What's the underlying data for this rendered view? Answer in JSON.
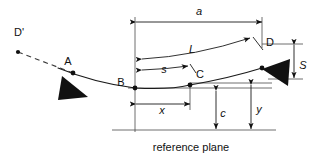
{
  "figure": {
    "type": "engineering-diagram",
    "background_color": "#ffffff",
    "line_color": "#1a1a1a",
    "thin_line_color": "#4a4a4a"
  },
  "points": {
    "d_prime": {
      "label": "D'",
      "x": 18,
      "y": 52,
      "label_x": 14,
      "label_y": 36
    },
    "a": {
      "label": "A",
      "x": 73,
      "y": 73,
      "label_x": 68,
      "label_y": 64
    },
    "b": {
      "label": "B",
      "x": 135,
      "y": 88,
      "label_x": 122,
      "label_y": 84
    },
    "c": {
      "label": "C",
      "x": 190,
      "y": 85,
      "label_x": 196,
      "label_y": 78
    },
    "d": {
      "label": "D",
      "x": 262,
      "y": 68,
      "label_x": 267,
      "label_y": 40
    }
  },
  "dimensions": {
    "a": {
      "label": "a",
      "label_x": 199,
      "label_y": 15,
      "orientation": "horizontal",
      "from_x": 136,
      "to_x": 262,
      "y": 22
    },
    "L": {
      "label": "L",
      "label_x": 192,
      "label_y": 53,
      "orientation": "curved",
      "from_x": 136,
      "to_x": 253,
      "note": "arc B to D"
    },
    "s": {
      "label": "s",
      "label_x": 164,
      "label_y": 73,
      "orientation": "curved",
      "from_x": 136,
      "to_x": 186,
      "note": "arc B to C"
    },
    "x": {
      "label": "x",
      "label_x": 162,
      "label_y": 113,
      "orientation": "horizontal",
      "from_x": 136,
      "to_x": 190,
      "y": 104
    },
    "c": {
      "label": "c",
      "label_x": 222,
      "label_y": 116,
      "orientation": "vertical",
      "x": 216,
      "from_y": 91,
      "to_y": 130
    },
    "y": {
      "label": "y",
      "label_x": 258,
      "label_y": 112,
      "orientation": "vertical",
      "x": 251,
      "from_y": 78,
      "to_y": 130
    },
    "S": {
      "label": "S",
      "label_x": 301,
      "label_y": 69,
      "orientation": "vertical",
      "x": 294,
      "from_y": 44,
      "to_y": 79
    }
  },
  "annotations": {
    "reference_plane": {
      "label": "reference plane",
      "label_x": 191,
      "label_y": 150,
      "line_y": 130,
      "line_from_x": 112,
      "line_to_x": 276
    }
  },
  "supports": [
    {
      "name": "support-at-a",
      "attached_to": "A",
      "orientation": "up"
    },
    {
      "name": "support-at-d",
      "attached_to": "D",
      "orientation": "right"
    }
  ]
}
